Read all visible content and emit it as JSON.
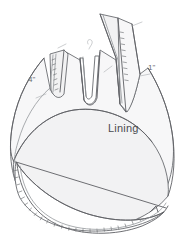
{
  "figure": {
    "labels": {
      "lining": "Lining",
      "left_dimension": "4\"",
      "right_dimension": "1\""
    },
    "colors": {
      "background": "#ffffff",
      "ink": "#5d5f63",
      "ink_soft": "#8e9195",
      "panel_shade": "#f2f2f3",
      "panel_shade_light": "#f7f7f8",
      "stitch": "#6f7276",
      "label_text": "#4a4c50"
    },
    "parts": [
      {
        "name": "left-strap",
        "label": ""
      },
      {
        "name": "right-strap",
        "label": ""
      },
      {
        "name": "center-notch",
        "label": ""
      },
      {
        "name": "lining-panel",
        "label": "Lining"
      },
      {
        "name": "body-shell",
        "label": ""
      },
      {
        "name": "bottom-seam",
        "label": ""
      }
    ]
  }
}
